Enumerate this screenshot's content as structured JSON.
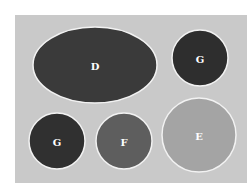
{
  "diagram": {
    "background_color": "#ffffff",
    "panel_color": "#c9c9c9",
    "outline_color": "#f2f2f2",
    "shapes": [
      {
        "id": "d",
        "label": "D",
        "shape": "ellipse",
        "fill": "#3a3a3a"
      },
      {
        "id": "g-top",
        "label": "G",
        "shape": "circle",
        "fill": "#2e2e2e"
      },
      {
        "id": "g-bottom",
        "label": "G",
        "shape": "circle",
        "fill": "#303030"
      },
      {
        "id": "f",
        "label": "F",
        "shape": "circle",
        "fill": "#5e5e5e"
      },
      {
        "id": "e",
        "label": "E",
        "shape": "circle",
        "fill": "#a4a4a4"
      }
    ]
  }
}
